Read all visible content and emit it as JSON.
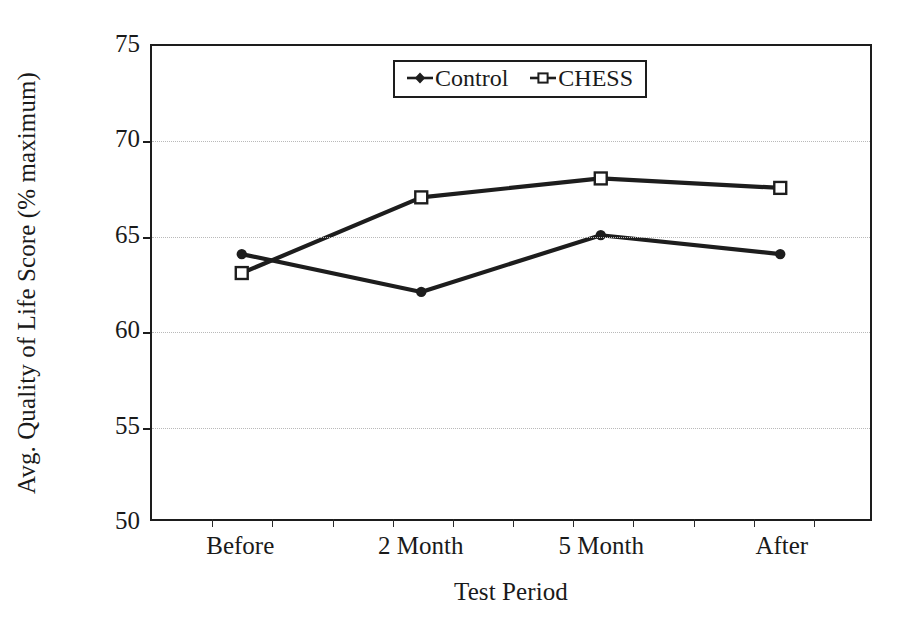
{
  "chart_data": {
    "type": "line",
    "title": "",
    "xlabel": "Test Period",
    "ylabel": "Avg. Quality of Life Score (% maximum)",
    "categories": [
      "Before",
      "2 Month",
      "5 Month",
      "After"
    ],
    "ylim": [
      50,
      75
    ],
    "yticks": [
      50,
      55,
      60,
      65,
      70,
      75
    ],
    "ytick_labels": [
      "50",
      "55",
      "60",
      "65",
      "70",
      "75"
    ],
    "grid": "horizontal-dotted",
    "legend_position": "top-center-inside",
    "series": [
      {
        "name": "Control",
        "marker": "filled-diamond",
        "color": "#1d1d1d",
        "values": [
          64,
          62,
          65,
          64
        ]
      },
      {
        "name": "CHESS",
        "marker": "open-square",
        "color": "#1d1d1d",
        "values": [
          63,
          67,
          68,
          67.5
        ]
      }
    ]
  },
  "legend": {
    "entries": [
      {
        "label": "Control"
      },
      {
        "label": "CHESS"
      }
    ]
  },
  "axes": {
    "y_title": "Avg. Quality of Life Score (% maximum)",
    "x_title": "Test Period"
  }
}
